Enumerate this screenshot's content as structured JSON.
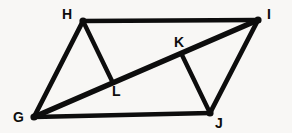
{
  "figure": {
    "background_color": "#f8f7f5",
    "ink_color": "#0d0d0d",
    "stroke_width": 4.4,
    "label_font_size": 14,
    "points": [
      {
        "name": "G",
        "x": 34,
        "y": 117,
        "label": "G",
        "label_x": 13,
        "label_y": 110,
        "dot": true
      },
      {
        "name": "H",
        "x": 83,
        "y": 21,
        "label": "H",
        "label_x": 62,
        "label_y": 7,
        "dot": true
      },
      {
        "name": "I",
        "x": 258,
        "y": 20,
        "label": "I",
        "label_x": 267,
        "label_y": 7,
        "dot": true
      },
      {
        "name": "J",
        "x": 210,
        "y": 113,
        "label": "J",
        "label_x": 215,
        "label_y": 116,
        "dot": true
      },
      {
        "name": "K",
        "x": 182,
        "y": 55,
        "label": "K",
        "label_x": 174,
        "label_y": 35,
        "dot": false
      },
      {
        "name": "L",
        "x": 112,
        "y": 81,
        "label": "L",
        "label_x": 112,
        "label_y": 84,
        "dot": false
      }
    ],
    "segments": [
      {
        "name": "segment-HI",
        "from": "H",
        "to": "I",
        "width": 4.6
      },
      {
        "name": "segment-GJ",
        "from": "G",
        "to": "J",
        "width": 4.6
      },
      {
        "name": "segment-GH",
        "from": "G",
        "to": "H",
        "width": 4.8
      },
      {
        "name": "segment-JI",
        "from": "J",
        "to": "I",
        "width": 4.8
      },
      {
        "name": "segment-GI-diagonal",
        "from": "G",
        "to": "I",
        "width": 5.4
      },
      {
        "name": "segment-HL",
        "from": "H",
        "to": "L",
        "width": 4.4
      },
      {
        "name": "segment-KJ",
        "from": "K",
        "to": "J",
        "width": 4.4
      }
    ],
    "labels_text": {
      "G": "G",
      "H": "H",
      "I": "I",
      "J": "J",
      "K": "K",
      "L": "L"
    }
  }
}
